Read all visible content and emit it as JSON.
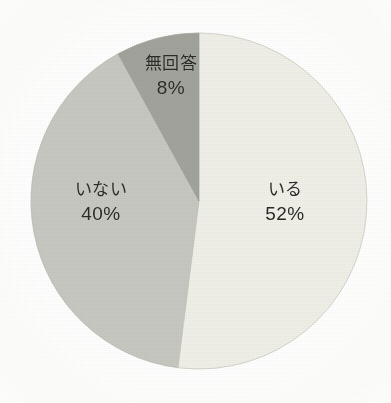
{
  "chart_data": {
    "type": "pie",
    "title": "",
    "subtitle": "",
    "xlabel": "",
    "ylabel": "",
    "legend_position": "none",
    "grid": false,
    "units": "%",
    "start_angle_deg": 0,
    "direction": "clockwise",
    "categories": [
      "いる",
      "いない",
      "無回答"
    ],
    "values": [
      52,
      40,
      8
    ],
    "labels": [
      "52%",
      "40%",
      "8%"
    ],
    "colors": [
      "#f0f0e8",
      "#c7c8c1",
      "#a2a39c"
    ],
    "slices": [
      {
        "name": "いる",
        "value": 52,
        "value_label": "52%",
        "color": "#f0f0e8",
        "start_deg": 0,
        "end_deg": 187.2
      },
      {
        "name": "いない",
        "value": 40,
        "value_label": "40%",
        "color": "#c7c8c1",
        "start_deg": 187.2,
        "end_deg": 331.2
      },
      {
        "name": "無回答",
        "value": 8,
        "value_label": "8%",
        "color": "#a2a39c",
        "start_deg": 331.2,
        "end_deg": 360
      }
    ]
  },
  "figure": {
    "background": "#ffffff",
    "outline_color": "#b9bab3",
    "center_x": 199,
    "center_y": 201,
    "radius": 168
  }
}
